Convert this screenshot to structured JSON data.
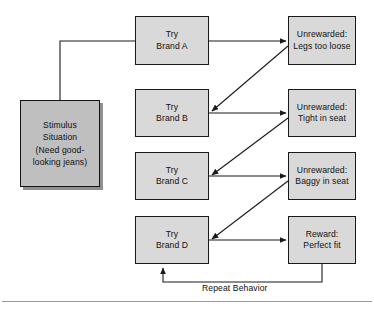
{
  "diagram": {
    "type": "flowchart",
    "nodes": [
      {
        "id": "stimulus",
        "name": "stimulus-situation-box",
        "lines": [
          "Stimulus",
          "Situation",
          "(Need good-",
          "looking jeans)"
        ],
        "x": 20,
        "y": 100,
        "w": 80,
        "h": 87,
        "fill": "#bfbfbf",
        "shadow": true
      },
      {
        "id": "brand-a",
        "name": "try-brand-a-box",
        "lines": [
          "Try",
          "Brand A"
        ],
        "x": 135,
        "y": 16,
        "w": 74,
        "h": 49,
        "fill": "#d9d9d9",
        "shadow": false
      },
      {
        "id": "brand-b",
        "name": "try-brand-b-box",
        "lines": [
          "Try",
          "Brand B"
        ],
        "x": 135,
        "y": 89,
        "w": 74,
        "h": 48,
        "fill": "#d9d9d9",
        "shadow": false
      },
      {
        "id": "brand-c",
        "name": "try-brand-c-box",
        "lines": [
          "Try",
          "Brand C"
        ],
        "x": 135,
        "y": 152,
        "w": 74,
        "h": 48,
        "fill": "#d9d9d9",
        "shadow": false
      },
      {
        "id": "brand-d",
        "name": "try-brand-d-box",
        "lines": [
          "Try",
          "Brand D"
        ],
        "x": 135,
        "y": 216,
        "w": 74,
        "h": 48,
        "fill": "#d9d9d9",
        "shadow": false
      },
      {
        "id": "outcome-a",
        "name": "unrewarded-legs-too-loose-box",
        "lines": [
          "Unrewarded:",
          "Legs too loose"
        ],
        "x": 288,
        "y": 16,
        "w": 68,
        "h": 49,
        "fill": "#d9d9d9",
        "shadow": false
      },
      {
        "id": "outcome-b",
        "name": "unrewarded-tight-in-seat-box",
        "lines": [
          "Unrewarded:",
          "Tight in seat"
        ],
        "x": 288,
        "y": 89,
        "w": 68,
        "h": 48,
        "fill": "#d9d9d9",
        "shadow": false
      },
      {
        "id": "outcome-c",
        "name": "unrewarded-baggy-in-seat-box",
        "lines": [
          "Unrewarded:",
          "Baggy in seat"
        ],
        "x": 288,
        "y": 152,
        "w": 68,
        "h": 48,
        "fill": "#d9d9d9",
        "shadow": false
      },
      {
        "id": "outcome-d",
        "name": "reward-perfect-fit-box",
        "lines": [
          "Reward:",
          "Perfect fit"
        ],
        "x": 288,
        "y": 216,
        "w": 68,
        "h": 48,
        "fill": "#d9d9d9",
        "shadow": false
      }
    ],
    "edges": [
      {
        "name": "stimulus-to-brand-a",
        "kind": "elbow",
        "from": "stimulus",
        "to": "brand-a",
        "arrow": false
      },
      {
        "name": "brand-a-to-outcome-a",
        "kind": "straight",
        "from": "brand-a",
        "to": "outcome-a",
        "arrow": true
      },
      {
        "name": "outcome-a-to-brand-b",
        "kind": "diagonal",
        "from": "outcome-a",
        "to": "brand-b",
        "arrow": true
      },
      {
        "name": "brand-b-to-outcome-b",
        "kind": "straight",
        "from": "brand-b",
        "to": "outcome-b",
        "arrow": true
      },
      {
        "name": "outcome-b-to-brand-c",
        "kind": "diagonal",
        "from": "outcome-b",
        "to": "brand-c",
        "arrow": true
      },
      {
        "name": "brand-c-to-outcome-c",
        "kind": "straight",
        "from": "brand-c",
        "to": "outcome-c",
        "arrow": true
      },
      {
        "name": "outcome-c-to-brand-d",
        "kind": "diagonal",
        "from": "outcome-c",
        "to": "brand-d",
        "arrow": true
      },
      {
        "name": "brand-d-to-outcome-d",
        "kind": "straight",
        "from": "brand-d",
        "to": "outcome-d",
        "arrow": true
      },
      {
        "name": "repeat-behavior-feedback",
        "kind": "elbow-feedback",
        "from": "outcome-d",
        "to": "brand-d",
        "arrow": true
      }
    ],
    "edge_labels": [
      {
        "name": "repeat-behavior-label",
        "text": "Repeat Behavior",
        "x": 202,
        "y": 283
      }
    ],
    "colors": {
      "stroke": "#1a1a1a",
      "box_fill": "#d9d9d9",
      "stimulus_fill": "#bfbfbf",
      "shadow": "#8f8f8f",
      "text": "#101010",
      "footer_rule": "#9a9a9a",
      "background": "#ffffff"
    }
  }
}
